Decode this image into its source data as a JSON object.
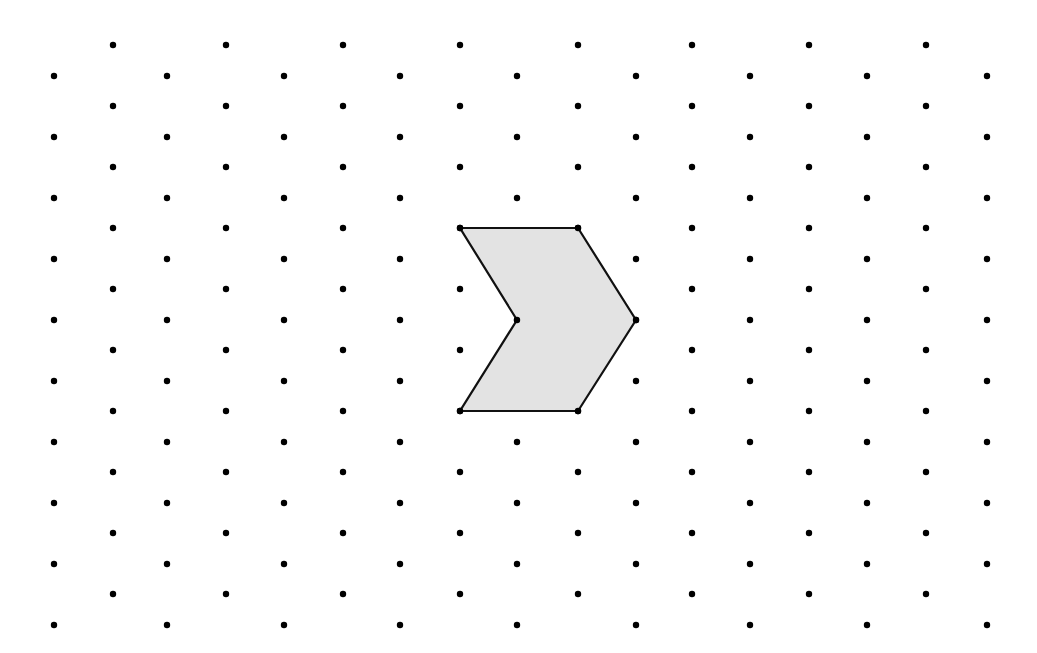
{
  "diagram": {
    "type": "isometric-dot-grid",
    "background": "#ffffff",
    "dot_color": "#000000",
    "dot_radius": 3.2,
    "grid": {
      "even_columns_x": [
        54,
        167,
        284,
        400,
        517,
        636,
        750,
        867,
        987
      ],
      "even_rows_y": [
        76,
        137,
        198,
        259,
        320,
        381,
        442,
        503,
        564,
        625
      ],
      "odd_columns_x": [
        113,
        226,
        343,
        460,
        578,
        692,
        809,
        926
      ],
      "odd_rows_y": [
        45,
        106,
        167,
        228,
        289,
        350,
        411,
        472,
        533,
        594
      ]
    },
    "shape": {
      "name": "chevron-hexagon",
      "fill": "#e3e3e3",
      "stroke": "#111111",
      "stroke_width": 2.2,
      "vertices": [
        [
          460,
          228
        ],
        [
          578,
          228
        ],
        [
          636,
          320
        ],
        [
          578,
          411
        ],
        [
          460,
          411
        ],
        [
          517,
          320
        ]
      ]
    }
  }
}
